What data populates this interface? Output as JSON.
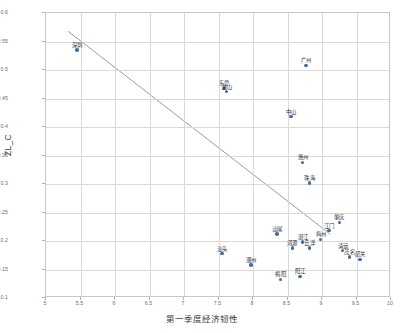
{
  "chart_data": {
    "type": "scatter",
    "title": "",
    "xlabel": "第一季度经济韧性",
    "ylabel": "ZL_C",
    "xlim": [
      5,
      10
    ],
    "ylim": [
      0.1,
      0.6
    ],
    "xticks": [
      "5",
      "5.5",
      "6",
      "6.5",
      "7",
      "7.5",
      "8",
      "8.5",
      "9",
      "9.5",
      "10"
    ],
    "yticks": [
      "0.1",
      "0.15",
      "0.2",
      "0.25",
      "0.3",
      "0.35",
      "0.4",
      "0.45",
      "0.5",
      "0.55",
      "0.6"
    ],
    "grid": true,
    "legend": "none",
    "marker_color": "#3b6fa8",
    "line_color": "#8f8f8f",
    "points": [
      {
        "label": "深圳",
        "x": 5.45,
        "y": 0.535
      },
      {
        "label": "东莞",
        "x": 7.58,
        "y": 0.468
      },
      {
        "label": "佛山",
        "x": 7.62,
        "y": 0.462
      },
      {
        "label": "广州",
        "x": 8.77,
        "y": 0.508
      },
      {
        "label": "中山",
        "x": 8.55,
        "y": 0.418
      },
      {
        "label": "惠州",
        "x": 8.72,
        "y": 0.338
      },
      {
        "label": "珠海",
        "x": 8.82,
        "y": 0.302
      },
      {
        "label": "肇庆",
        "x": 9.25,
        "y": 0.233
      },
      {
        "label": "江门",
        "x": 9.1,
        "y": 0.218
      },
      {
        "label": "梅州",
        "x": 8.98,
        "y": 0.203
      },
      {
        "label": "汕尾",
        "x": 8.35,
        "y": 0.212
      },
      {
        "label": "湛江",
        "x": 8.72,
        "y": 0.198
      },
      {
        "label": "河源",
        "x": 8.57,
        "y": 0.188
      },
      {
        "label": "云浮",
        "x": 8.82,
        "y": 0.188
      },
      {
        "label": "清远",
        "x": 9.3,
        "y": 0.183
      },
      {
        "label": "茂名",
        "x": 9.4,
        "y": 0.172
      },
      {
        "label": "韶关",
        "x": 9.55,
        "y": 0.168
      },
      {
        "label": "汕头",
        "x": 7.55,
        "y": 0.178
      },
      {
        "label": "潮州",
        "x": 7.97,
        "y": 0.158
      },
      {
        "label": "揭阳",
        "x": 8.4,
        "y": 0.133
      },
      {
        "label": "阳江",
        "x": 8.68,
        "y": 0.138
      }
    ],
    "trendline": {
      "x0": 5.32,
      "y0": 0.568,
      "x1": 9.12,
      "y1": 0.212
    }
  }
}
